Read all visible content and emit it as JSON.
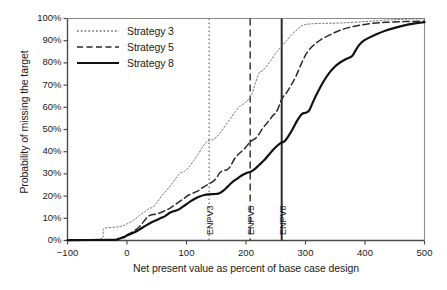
{
  "chart_data": {
    "type": "line",
    "title": "",
    "xlabel": "Net present value as percent of base case design",
    "ylabel": "Probability of missing the target",
    "xlim": [
      -100,
      500
    ],
    "ylim": [
      0,
      100
    ],
    "xticks": [
      -100,
      0,
      100,
      200,
      300,
      400,
      500
    ],
    "xtick_labels": [
      "−100",
      "0",
      "100",
      "200",
      "300",
      "400",
      "500"
    ],
    "yticks": [
      0,
      10,
      20,
      30,
      40,
      50,
      60,
      70,
      80,
      90,
      100
    ],
    "ytick_labels": [
      "0%",
      "10%",
      "20%",
      "30%",
      "40%",
      "50%",
      "60%",
      "70%",
      "80%",
      "90%",
      "100%"
    ],
    "grid": false,
    "legend_position": "upper left",
    "series": [
      {
        "name": "Strategy 3",
        "style": "dotted",
        "color": "#6b6b6b",
        "width": 1.0,
        "points": [
          [
            -100,
            0.3
          ],
          [
            -60,
            0.5
          ],
          [
            -42,
            1.0
          ],
          [
            -40,
            4.0
          ],
          [
            -38,
            5.5
          ],
          [
            -20,
            6.0
          ],
          [
            -8,
            6.5
          ],
          [
            0,
            7.5
          ],
          [
            10,
            9.0
          ],
          [
            20,
            11.0
          ],
          [
            30,
            13.0
          ],
          [
            38,
            14.5
          ],
          [
            44,
            15.0
          ],
          [
            50,
            17.0
          ],
          [
            58,
            20.0
          ],
          [
            66,
            22.5
          ],
          [
            74,
            25.0
          ],
          [
            82,
            28.0
          ],
          [
            90,
            30.5
          ],
          [
            96,
            31.0
          ],
          [
            104,
            33.0
          ],
          [
            112,
            36.0
          ],
          [
            120,
            39.0
          ],
          [
            128,
            42.5
          ],
          [
            136,
            44.8
          ],
          [
            142,
            45.2
          ],
          [
            150,
            46.5
          ],
          [
            158,
            49.0
          ],
          [
            166,
            52.0
          ],
          [
            174,
            55.0
          ],
          [
            182,
            58.0
          ],
          [
            190,
            60.5
          ],
          [
            198,
            62.0
          ],
          [
            204,
            63.5
          ],
          [
            210,
            66.0
          ],
          [
            216,
            71.0
          ],
          [
            222,
            75.5
          ],
          [
            228,
            76.5
          ],
          [
            236,
            79.0
          ],
          [
            244,
            82.0
          ],
          [
            252,
            85.0
          ],
          [
            260,
            87.5
          ],
          [
            268,
            90.0
          ],
          [
            276,
            92.5
          ],
          [
            286,
            95.0
          ],
          [
            296,
            97.0
          ],
          [
            310,
            97.6
          ],
          [
            330,
            97.8
          ],
          [
            360,
            98.0
          ],
          [
            400,
            98.6
          ],
          [
            430,
            99.2
          ],
          [
            460,
            99.6
          ],
          [
            500,
            99.9
          ]
        ]
      },
      {
        "name": "Strategy 5",
        "style": "dashed",
        "color": "#2b2b2b",
        "width": 1.5,
        "points": [
          [
            -100,
            0.2
          ],
          [
            -30,
            0.3
          ],
          [
            -18,
            0.5
          ],
          [
            -10,
            1.2
          ],
          [
            0,
            2.5
          ],
          [
            10,
            4.0
          ],
          [
            20,
            6.0
          ],
          [
            28,
            8.5
          ],
          [
            34,
            10.5
          ],
          [
            40,
            11.5
          ],
          [
            48,
            11.8
          ],
          [
            56,
            12.5
          ],
          [
            64,
            13.5
          ],
          [
            72,
            14.5
          ],
          [
            80,
            16.0
          ],
          [
            88,
            17.5
          ],
          [
            96,
            19.0
          ],
          [
            104,
            20.5
          ],
          [
            112,
            21.5
          ],
          [
            120,
            22.5
          ],
          [
            128,
            24.0
          ],
          [
            136,
            25.2
          ],
          [
            144,
            26.5
          ],
          [
            150,
            28.0
          ],
          [
            156,
            30.5
          ],
          [
            162,
            31.5
          ],
          [
            168,
            31.8
          ],
          [
            174,
            33.5
          ],
          [
            180,
            36.5
          ],
          [
            186,
            38.5
          ],
          [
            192,
            40.0
          ],
          [
            198,
            41.5
          ],
          [
            204,
            43.5
          ],
          [
            210,
            45.0
          ],
          [
            216,
            46.0
          ],
          [
            222,
            48.0
          ],
          [
            228,
            50.5
          ],
          [
            234,
            52.5
          ],
          [
            240,
            54.5
          ],
          [
            246,
            56.5
          ],
          [
            250,
            57.5
          ],
          [
            254,
            59.5
          ],
          [
            258,
            62.5
          ],
          [
            262,
            64.5
          ],
          [
            268,
            66.5
          ],
          [
            276,
            70.0
          ],
          [
            284,
            74.0
          ],
          [
            292,
            79.0
          ],
          [
            300,
            83.5
          ],
          [
            308,
            86.5
          ],
          [
            316,
            88.5
          ],
          [
            326,
            90.5
          ],
          [
            340,
            92.5
          ],
          [
            356,
            94.5
          ],
          [
            374,
            96.0
          ],
          [
            392,
            97.0
          ],
          [
            412,
            97.8
          ],
          [
            436,
            98.3
          ],
          [
            466,
            98.6
          ],
          [
            500,
            98.8
          ]
        ]
      },
      {
        "name": "Strategy 8",
        "style": "solid",
        "color": "#111111",
        "width": 2.2,
        "points": [
          [
            -100,
            0.2
          ],
          [
            -24,
            0.3
          ],
          [
            -16,
            0.6
          ],
          [
            -8,
            1.2
          ],
          [
            0,
            2.2
          ],
          [
            8,
            3.2
          ],
          [
            16,
            4.2
          ],
          [
            24,
            5.5
          ],
          [
            32,
            6.8
          ],
          [
            40,
            8.0
          ],
          [
            48,
            9.0
          ],
          [
            56,
            10.0
          ],
          [
            64,
            11.0
          ],
          [
            72,
            12.5
          ],
          [
            78,
            13.2
          ],
          [
            84,
            13.6
          ],
          [
            90,
            14.5
          ],
          [
            98,
            16.0
          ],
          [
            106,
            17.5
          ],
          [
            114,
            18.8
          ],
          [
            122,
            19.8
          ],
          [
            130,
            20.5
          ],
          [
            138,
            20.8
          ],
          [
            146,
            20.9
          ],
          [
            154,
            21.2
          ],
          [
            162,
            22.5
          ],
          [
            170,
            24.5
          ],
          [
            178,
            26.5
          ],
          [
            186,
            28.0
          ],
          [
            194,
            29.5
          ],
          [
            202,
            30.5
          ],
          [
            208,
            31.0
          ],
          [
            214,
            32.0
          ],
          [
            222,
            34.0
          ],
          [
            230,
            36.0
          ],
          [
            238,
            38.5
          ],
          [
            246,
            41.0
          ],
          [
            254,
            43.0
          ],
          [
            259,
            44.0
          ],
          [
            264,
            44.5
          ],
          [
            270,
            46.5
          ],
          [
            278,
            50.0
          ],
          [
            286,
            54.0
          ],
          [
            294,
            57.0
          ],
          [
            300,
            57.5
          ],
          [
            306,
            58.5
          ],
          [
            312,
            62.0
          ],
          [
            320,
            66.5
          ],
          [
            330,
            71.5
          ],
          [
            340,
            75.5
          ],
          [
            350,
            78.5
          ],
          [
            360,
            80.5
          ],
          [
            370,
            82.0
          ],
          [
            378,
            83.0
          ],
          [
            384,
            85.5
          ],
          [
            390,
            88.0
          ],
          [
            398,
            90.0
          ],
          [
            408,
            91.5
          ],
          [
            420,
            93.0
          ],
          [
            434,
            94.5
          ],
          [
            450,
            95.8
          ],
          [
            468,
            97.0
          ],
          [
            484,
            97.8
          ],
          [
            500,
            98.3
          ]
        ]
      }
    ],
    "vertical_markers": [
      {
        "label": "ENPV3",
        "x": 138,
        "style": "dotted",
        "color": "#7a7a7a",
        "width": 1.4
      },
      {
        "label": "ENPV5",
        "x": 207,
        "style": "dashed",
        "color": "#2b2b2b",
        "width": 1.4
      },
      {
        "label": "ENPV8",
        "x": 260,
        "style": "solid",
        "color": "#2b2b2b",
        "width": 2.0
      }
    ]
  },
  "legend": {
    "items": [
      {
        "label": "Strategy 3"
      },
      {
        "label": "Strategy 5"
      },
      {
        "label": "Strategy 8"
      }
    ]
  }
}
